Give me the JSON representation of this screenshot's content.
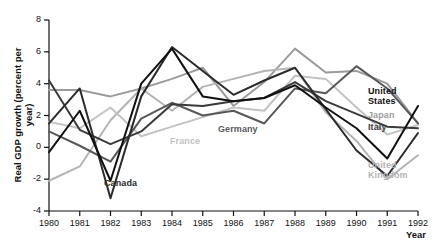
{
  "chart_data": {
    "type": "line",
    "title": "",
    "xlabel": "Year",
    "ylabel": "Real GDP growth (percent per year)",
    "x": [
      1980,
      1981,
      1982,
      1983,
      1984,
      1985,
      1986,
      1987,
      1988,
      1989,
      1990,
      1991,
      1992
    ],
    "xlim": [
      1980,
      1992
    ],
    "ylim": [
      -4,
      8
    ],
    "yticks": [
      -4,
      -2,
      0,
      2,
      4,
      6,
      8
    ],
    "xticks": [
      "1980",
      "1981",
      "1982",
      "1983",
      "1984",
      "1985",
      "1986",
      "1987",
      "1988",
      "1989",
      "1990",
      "1991",
      "1992"
    ],
    "grid": false,
    "legend_position": "inline-annotations",
    "series": [
      {
        "name": "United States",
        "color": "#111111",
        "label_x": 368,
        "label_y": 86,
        "values": [
          -0.3,
          2.3,
          -2.1,
          4.0,
          6.2,
          3.2,
          2.9,
          3.1,
          3.9,
          2.5,
          1.2,
          -0.7,
          2.6
        ]
      },
      {
        "name": "Japan",
        "color": "#9b9b9b",
        "label_x": 368,
        "label_y": 110,
        "values": [
          3.6,
          3.6,
          3.2,
          3.7,
          4.3,
          5.0,
          2.6,
          4.1,
          6.2,
          4.7,
          4.8,
          4.0,
          1.5
        ]
      },
      {
        "name": "Italy",
        "color": "#3a3a3a",
        "label_x": 368,
        "label_y": 122,
        "values": [
          4.2,
          1.1,
          0.2,
          1.0,
          2.7,
          2.6,
          2.9,
          3.1,
          4.1,
          2.9,
          2.1,
          1.3,
          1.2
        ]
      },
      {
        "name": "United Kingdom",
        "color": "#b4b4b4",
        "label_x": 368,
        "label_y": 160,
        "values": [
          -2.1,
          -1.2,
          1.7,
          3.7,
          2.3,
          3.8,
          4.3,
          4.8,
          5.0,
          2.2,
          0.4,
          -2.0,
          -0.5
        ]
      },
      {
        "name": "Germany",
        "color": "#585858",
        "label_x": 218,
        "label_y": 124,
        "values": [
          1.0,
          0.1,
          -0.9,
          1.8,
          2.8,
          2.0,
          2.3,
          1.5,
          3.7,
          3.4,
          5.1,
          3.7,
          1.5
        ]
      },
      {
        "name": "France",
        "color": "#c2c2c2",
        "label_x": 170,
        "label_y": 136,
        "values": [
          1.6,
          1.2,
          2.5,
          0.7,
          1.3,
          1.9,
          2.5,
          2.3,
          4.5,
          4.3,
          2.5,
          0.8,
          1.4
        ]
      },
      {
        "name": "Canada",
        "color": "#2b2b2b",
        "label_x": 104,
        "label_y": 178,
        "values": [
          1.5,
          3.7,
          -3.2,
          3.2,
          6.3,
          4.8,
          3.3,
          4.2,
          5.0,
          2.4,
          -0.2,
          -1.8,
          0.9
        ]
      }
    ],
    "annotations": [
      {
        "text": "United States",
        "style": "dark"
      },
      {
        "text": "Japan",
        "style": "mid"
      },
      {
        "text": "Italy",
        "style": "dark"
      },
      {
        "text": "United Kingdom",
        "style": "light"
      },
      {
        "text": "Germany",
        "style": "dark"
      },
      {
        "text": "France",
        "style": "light"
      },
      {
        "text": "Canada",
        "style": "dark"
      }
    ]
  },
  "axis": {
    "y_title": "Real GDP growth (percent per year)",
    "x_title": "Year"
  }
}
